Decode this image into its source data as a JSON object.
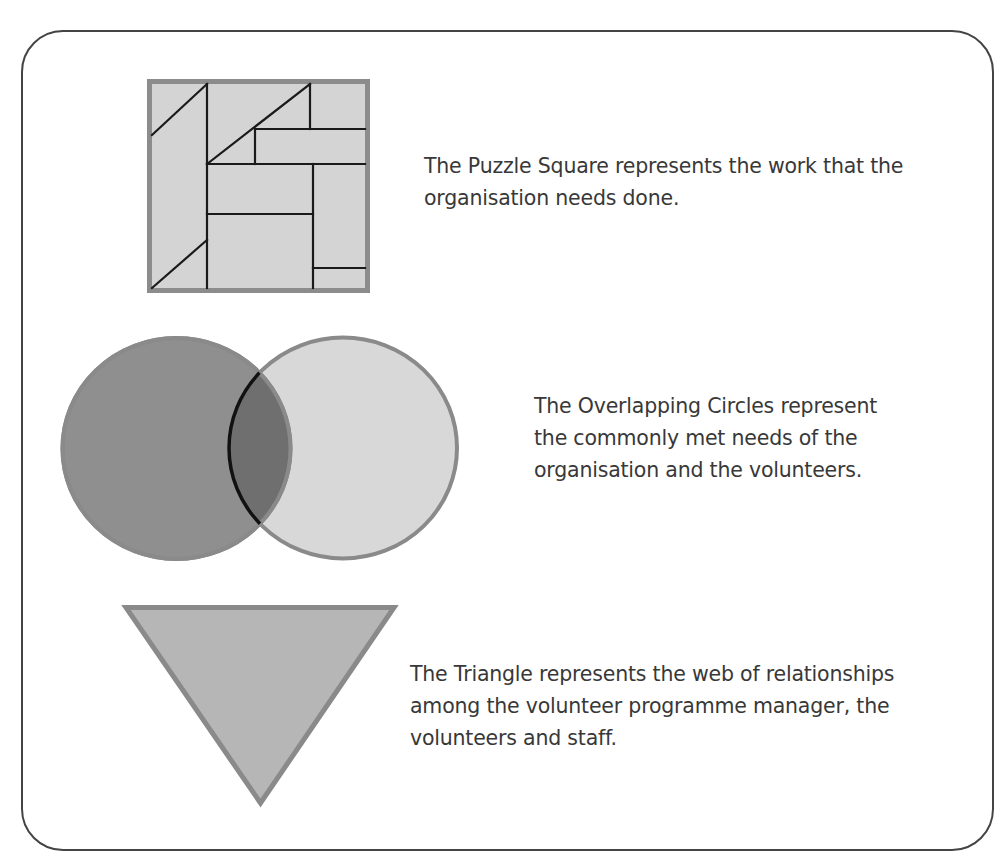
{
  "clipped_top_text": "... highlighting the ... ... ... ...",
  "frame": {
    "stroke_color": "#444444"
  },
  "colors": {
    "puzzle_fill": "#d4d4d4",
    "puzzle_border": "#8c8c8c",
    "puzzle_lines": "#1a1a1a",
    "circle_left_fill": "#8f8f8f",
    "circle_right_fill": "#d8d8d8",
    "circle_overlap_fill": "#6f6f6f",
    "circle_border": "#8a8a8a",
    "overlap_arc": "#111111",
    "triangle_fill": "#b6b6b6",
    "triangle_border": "#8a8a8a",
    "text": "#383838"
  },
  "items": [
    {
      "shape": "puzzle-square",
      "lines": [
        "The Puzzle Square represents the work that the",
        "organisation needs done."
      ]
    },
    {
      "shape": "overlapping-circles",
      "lines": [
        "The Overlapping Circles represent",
        "the commonly met needs of the",
        "organisation and the volunteers."
      ]
    },
    {
      "shape": "inverted-triangle",
      "lines": [
        "The Triangle represents the web of relationships",
        "among the volunteer programme manager, the",
        "volunteers and staff."
      ]
    }
  ]
}
